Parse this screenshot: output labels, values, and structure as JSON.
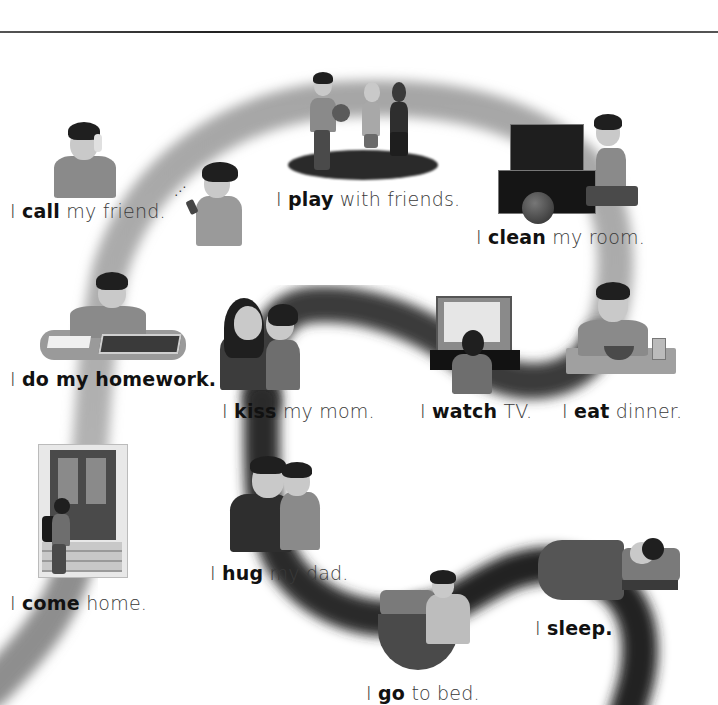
{
  "page": {
    "style": "grayscale textbook illustration",
    "path_color_light": "#9a9a9a",
    "path_color_dark": "#2a2a2a",
    "rule_color": "#333333"
  },
  "captions": [
    {
      "id": "call",
      "pronoun": "I",
      "verb": "call",
      "rest": "my friend.",
      "all_bold": false
    },
    {
      "id": "play",
      "pronoun": "I",
      "verb": "play",
      "rest": "with friends.",
      "all_bold": false
    },
    {
      "id": "clean",
      "pronoun": "I",
      "verb": "clean",
      "rest": "my room.",
      "all_bold": false
    },
    {
      "id": "homework",
      "pronoun": "I",
      "verb": "do my homework.",
      "rest": "",
      "all_bold": true
    },
    {
      "id": "kiss",
      "pronoun": "I",
      "verb": "kiss",
      "rest": "my mom.",
      "all_bold": false
    },
    {
      "id": "watch",
      "pronoun": "I",
      "verb": "watch",
      "rest": "TV.",
      "all_bold": false
    },
    {
      "id": "eat",
      "pronoun": "I",
      "verb": "eat",
      "rest": "dinner.",
      "all_bold": false
    },
    {
      "id": "come",
      "pronoun": "I",
      "verb": "come",
      "rest": "home.",
      "all_bold": false
    },
    {
      "id": "hug",
      "pronoun": "I",
      "verb": "hug",
      "rest": "my dad.",
      "all_bold": false
    },
    {
      "id": "sleep",
      "pronoun": "I",
      "verb": "sleep.",
      "rest": "",
      "all_bold": true
    },
    {
      "id": "go",
      "pronoun": "I",
      "verb": "go",
      "rest": "to bed.",
      "all_bold": false
    }
  ],
  "scenes": [
    {
      "id": "call",
      "description": "boy talking on phone and girl with cell phone"
    },
    {
      "id": "play",
      "description": "three children standing, one holding a ball"
    },
    {
      "id": "clean",
      "description": "boy kneeling by open toy chest with ball"
    },
    {
      "id": "homework",
      "description": "boy writing at table with open book"
    },
    {
      "id": "kiss",
      "description": "boy kissing his mother"
    },
    {
      "id": "watch",
      "description": "boy sitting in front of television"
    },
    {
      "id": "eat",
      "description": "boy eating from bowl with glass"
    },
    {
      "id": "come",
      "description": "boy with backpack climbing steps to door"
    },
    {
      "id": "hug",
      "description": "boy hugging his father"
    },
    {
      "id": "go",
      "description": "boy getting into bed"
    },
    {
      "id": "sleep",
      "description": "boy sleeping in bed"
    }
  ]
}
